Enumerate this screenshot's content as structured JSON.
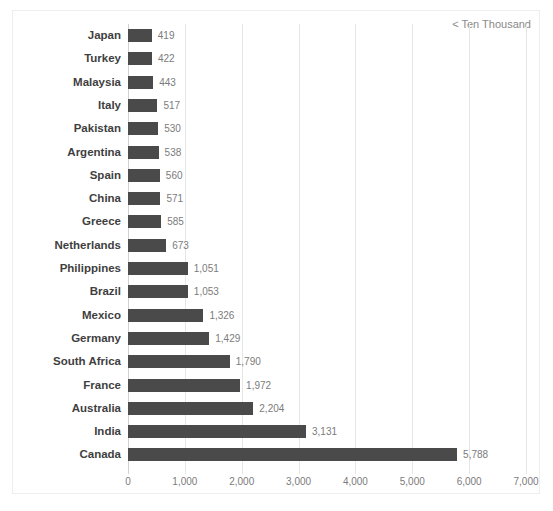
{
  "annotation": {
    "text": "< Ten Thousand"
  },
  "chart_data": {
    "type": "bar",
    "orientation": "horizontal",
    "title": "",
    "subtitle": "",
    "xlabel": "",
    "ylabel": "",
    "xlim": [
      0,
      7000
    ],
    "grid": true,
    "legend": "none",
    "annotations": [
      "< Ten Thousand"
    ],
    "bar_color": "#4a4a4a",
    "gridline_color": "#e6e6e6",
    "label_color": "#3f3f3f",
    "value_color": "#7b7b7b",
    "xticks": [
      0,
      1000,
      2000,
      3000,
      4000,
      5000,
      6000,
      7000
    ],
    "xtick_labels": [
      "0",
      "1,000",
      "2,000",
      "3,000",
      "4,000",
      "5,000",
      "6,000",
      "7,000"
    ],
    "categories": [
      "Japan",
      "Turkey",
      "Malaysia",
      "Italy",
      "Pakistan",
      "Argentina",
      "Spain",
      "China",
      "Greece",
      "Netherlands",
      "Philippines",
      "Brazil",
      "Mexico",
      "Germany",
      "South Africa",
      "France",
      "Australia",
      "India",
      "Canada"
    ],
    "values": [
      419,
      422,
      443,
      517,
      530,
      538,
      560,
      571,
      585,
      673,
      1051,
      1053,
      1326,
      1429,
      1790,
      1972,
      2204,
      3131,
      5788
    ],
    "value_labels": [
      "419",
      "422",
      "443",
      "517",
      "530",
      "538",
      "560",
      "571",
      "585",
      "673",
      "1,051",
      "1,053",
      "1,326",
      "1,429",
      "1,790",
      "1,972",
      "2,204",
      "3,131",
      "5,788"
    ]
  }
}
